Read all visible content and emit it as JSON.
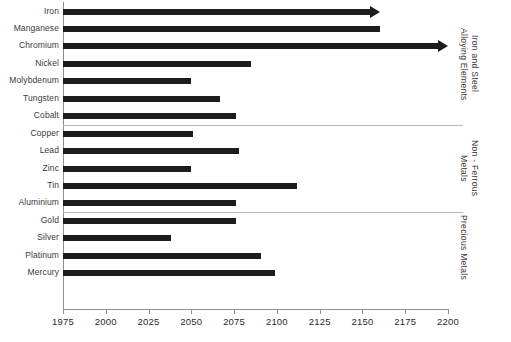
{
  "chart_data": {
    "type": "bar",
    "orientation": "horizontal",
    "title": "",
    "xlabel": "",
    "ylabel": "",
    "xlim": [
      1975,
      2200
    ],
    "xticks": [
      1975,
      2000,
      2025,
      2050,
      2075,
      2100,
      2125,
      2150,
      2175,
      2200
    ],
    "xtick_labels": [
      "1975",
      "2000",
      "2025",
      "2050",
      "2075",
      "2100",
      "2125",
      "2150",
      "2175",
      "2200"
    ],
    "grid": false,
    "legend": "none",
    "bar_start": 1975,
    "categories": [
      "Iron",
      "Manganese",
      "Chromium",
      "Nickel",
      "Molybdenum",
      "Tungsten",
      "Cobalt",
      "Copper",
      "Lead",
      "Zinc",
      "Tin",
      "Aluminium",
      "Gold",
      "Silver",
      "Platinum",
      "Mercury"
    ],
    "values": [
      2160,
      2160,
      2200,
      2085,
      2050,
      2067,
      2076,
      2051,
      2078,
      2050,
      2112,
      2076,
      2076,
      2038,
      2091,
      2099
    ],
    "bars": [
      {
        "label": "Iron",
        "start": 1975,
        "end": 2160,
        "arrow": true
      },
      {
        "label": "Manganese",
        "start": 1975,
        "end": 2160,
        "arrow": false
      },
      {
        "label": "Chromium",
        "start": 1975,
        "end": 2200,
        "arrow": true
      },
      {
        "label": "Nickel",
        "start": 1975,
        "end": 2085,
        "arrow": false
      },
      {
        "label": "Molybdenum",
        "start": 1975,
        "end": 2050,
        "arrow": false
      },
      {
        "label": "Tungsten",
        "start": 1975,
        "end": 2067,
        "arrow": false
      },
      {
        "label": "Cobalt",
        "start": 1975,
        "end": 2076,
        "arrow": false
      },
      {
        "label": "Copper",
        "start": 1975,
        "end": 2051,
        "arrow": false
      },
      {
        "label": "Lead",
        "start": 1975,
        "end": 2078,
        "arrow": false
      },
      {
        "label": "Zinc",
        "start": 1975,
        "end": 2050,
        "arrow": false
      },
      {
        "label": "Tin",
        "start": 1975,
        "end": 2112,
        "arrow": false
      },
      {
        "label": "Aluminium",
        "start": 1975,
        "end": 2076,
        "arrow": false
      },
      {
        "label": "Gold",
        "start": 1975,
        "end": 2076,
        "arrow": false
      },
      {
        "label": "Silver",
        "start": 1975,
        "end": 2038,
        "arrow": false
      },
      {
        "label": "Platinum",
        "start": 1975,
        "end": 2091,
        "arrow": false
      },
      {
        "label": "Mercury",
        "start": 1975,
        "end": 2099,
        "arrow": false
      }
    ],
    "groups": [
      {
        "name": "Iron and Steel\nAlloying Elements",
        "first": 0,
        "last": 6
      },
      {
        "name": "Non - Ferrous\nMetals",
        "first": 7,
        "last": 11
      },
      {
        "name": "Precious Metals",
        "first": 12,
        "last": 15
      }
    ],
    "colors": {
      "bar": "#1c1c1c",
      "axis": "#8f8f8f",
      "separator": "#b9b9b9",
      "text": "#2b2b2b",
      "background": "#ffffff"
    }
  }
}
